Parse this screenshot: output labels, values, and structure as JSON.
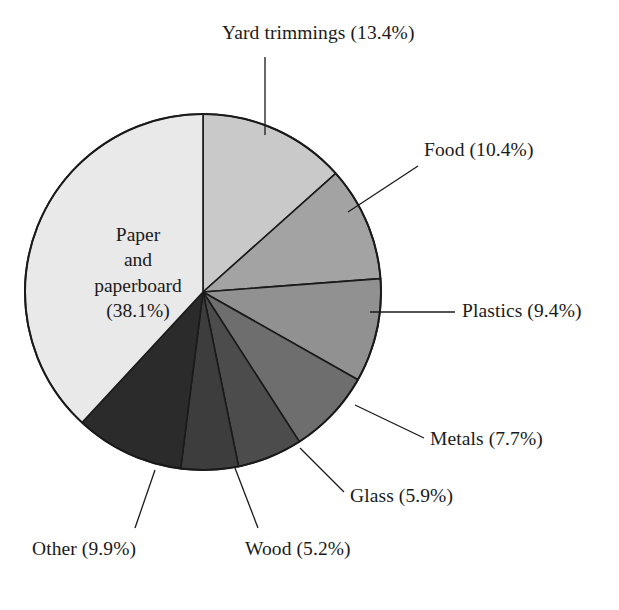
{
  "chart_data": {
    "type": "pie",
    "title": "",
    "subtitle": "",
    "xlabel": "",
    "ylabel": "",
    "legend_position": "none",
    "grid": false,
    "units": "percent",
    "start_angle_deg": 0,
    "direction": "clockwise",
    "center": {
      "x": 203,
      "y": 292
    },
    "radius": 178,
    "categories": [
      "Yard trimmings",
      "Food",
      "Plastics",
      "Metals",
      "Glass",
      "Wood",
      "Other",
      "Paper and paperboard"
    ],
    "values": [
      13.4,
      10.4,
      9.4,
      7.7,
      5.9,
      5.2,
      9.9,
      38.1
    ],
    "colors": [
      "#c9c9c9",
      "#a3a3a3",
      "#919191",
      "#6e6e6e",
      "#4c4c4c",
      "#3d3d3d",
      "#2b2b2b",
      "#e9e9e9"
    ],
    "slices": [
      {
        "name": "Yard trimmings",
        "label": "Yard trimmings (13.4%)",
        "value": 13.4,
        "color": "#c9c9c9",
        "label_x": 222,
        "label_y": 22,
        "label_align": "left",
        "leader": [
          [
            265,
            57
          ],
          [
            265,
            135
          ]
        ]
      },
      {
        "name": "Food",
        "label": "Food (10.4%)",
        "value": 10.4,
        "color": "#a3a3a3",
        "label_x": 424,
        "label_y": 139,
        "label_align": "left",
        "leader": [
          [
            418,
            166
          ],
          [
            348,
            212
          ]
        ]
      },
      {
        "name": "Plastics",
        "label": "Plastics (9.4%)",
        "value": 9.4,
        "color": "#919191",
        "label_x": 462,
        "label_y": 300,
        "label_align": "left",
        "leader": [
          [
            455,
            312
          ],
          [
            370,
            312
          ]
        ]
      },
      {
        "name": "Metals",
        "label": "Metals (7.7%)",
        "value": 7.7,
        "color": "#6e6e6e",
        "label_x": 430,
        "label_y": 428,
        "label_align": "left",
        "leader": [
          [
            424,
            438
          ],
          [
            355,
            405
          ]
        ]
      },
      {
        "name": "Glass",
        "label": "Glass (5.9%)",
        "value": 5.9,
        "color": "#4c4c4c",
        "label_x": 350,
        "label_y": 485,
        "label_align": "left",
        "leader": [
          [
            344,
            492
          ],
          [
            300,
            448
          ]
        ]
      },
      {
        "name": "Wood",
        "label": "Wood (5.2%)",
        "value": 5.2,
        "color": "#3d3d3d",
        "label_x": 245,
        "label_y": 538,
        "label_align": "left",
        "leader": [
          [
            258,
            528
          ],
          [
            235,
            468
          ]
        ]
      },
      {
        "name": "Other",
        "label": "Other (9.9%)",
        "value": 9.9,
        "color": "#2b2b2b",
        "label_x": 32,
        "label_y": 538,
        "label_align": "left",
        "leader": [
          [
            135,
            528
          ],
          [
            155,
            470
          ]
        ]
      },
      {
        "name": "Paper and paperboard",
        "label": "Paper and paperboard (38.1%)",
        "value": 38.1,
        "color": "#e9e9e9",
        "inner": true
      }
    ],
    "inner_label": {
      "line1": "Paper",
      "line2": "and",
      "line3": "paperboard",
      "line4": "(38.1%)",
      "x": 53,
      "y": 222,
      "width": 170
    }
  }
}
